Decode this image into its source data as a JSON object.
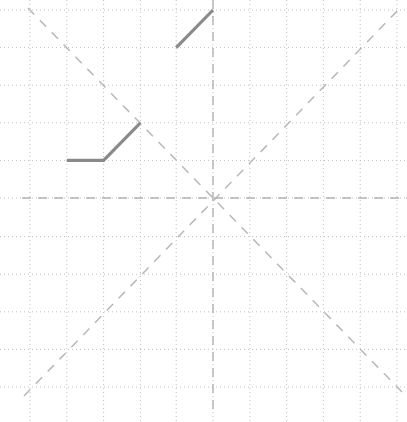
{
  "canvas": {
    "width": 407,
    "height": 422,
    "background": "#ffffff"
  },
  "grid": {
    "label": "graph-paper-grid",
    "color": "#bfbfbf",
    "stroke_width": 1,
    "dash_pattern": "1,3",
    "cell_size": 36.8,
    "vertical_lines_x": [
      30,
      66.8,
      103.6,
      140.4,
      176.2,
      213,
      249.8,
      286.6,
      323.4,
      360.2,
      397
    ],
    "horizontal_lines_y": [
      10,
      47.6,
      85.2,
      122.8,
      160.4,
      198,
      236.6,
      274.2,
      311.8,
      349.4,
      387
    ]
  },
  "axes": {
    "label": "center-axes",
    "color": "#b3b3b3",
    "stroke_width": 1.4,
    "dash_pattern": "9,7",
    "origin_x": 213,
    "origin_y": 198,
    "horizontal": {
      "x1": 22,
      "y1": 198,
      "x2": 407,
      "y2": 198
    },
    "vertical": {
      "x1": 213,
      "y1": 0,
      "x2": 213,
      "y2": 412
    }
  },
  "diagonals": {
    "label": "diagonal-guides",
    "color": "#b8b8b8",
    "stroke_width": 1.5,
    "dash_pattern": "9,8",
    "lines": [
      {
        "name": "diagonal-descending",
        "x1": 28,
        "y1": 8,
        "x2": 403,
        "y2": 393
      },
      {
        "name": "diagonal-ascending",
        "x1": 24,
        "y1": 396,
        "x2": 402,
        "y2": 6
      }
    ]
  },
  "data_lines": {
    "label": "solid-polylines",
    "color": "#8a8a8a",
    "stroke_width": 3.2,
    "segments": [
      {
        "name": "lower-left-polyline",
        "points": "66.8,160.4 103.6,160.4 140.4,122.8"
      },
      {
        "name": "upper-right-segment",
        "points": "176.2,47.6 213,10"
      }
    ]
  },
  "chart_data": {
    "type": "line",
    "title": "",
    "xlabel": "",
    "ylabel": "",
    "xlim": [
      -5.2,
      5.3
    ],
    "ylim": [
      -5.8,
      5.1
    ],
    "grid": true,
    "legend": "none",
    "tick_labels": {
      "x": [],
      "y": []
    },
    "annotations": [],
    "series": [
      {
        "name": "lower-left-polyline",
        "style": "solid",
        "color": "#8a8a8a",
        "x": [
          -4,
          -3,
          -2
        ],
        "y": [
          1,
          1,
          2
        ]
      },
      {
        "name": "upper-right-segment",
        "style": "solid",
        "color": "#8a8a8a",
        "x": [
          -1,
          0
        ],
        "y": [
          4,
          5
        ]
      },
      {
        "name": "diagonal-descending",
        "style": "dashed",
        "color": "#b8b8b8",
        "x": [
          -5,
          5
        ],
        "y": [
          5,
          -5
        ]
      },
      {
        "name": "diagonal-ascending",
        "style": "dashed",
        "color": "#b8b8b8",
        "x": [
          -5,
          5
        ],
        "y": [
          -5,
          5
        ]
      }
    ]
  }
}
